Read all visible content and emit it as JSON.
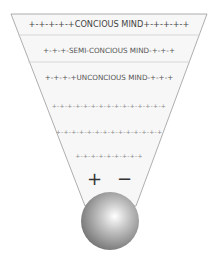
{
  "diagram": {
    "title": "",
    "levels": [
      {
        "label": "+-+-+-+-+CONCIOUS MIND+-+-+-+-+",
        "y": 18
      },
      {
        "label": "+-+-+-SEMI-CONCIOUS MIND-+-+-+",
        "y": 45
      },
      {
        "label": "+-+-+-+UNCONCIOUS MIND-+-+-+",
        "y": 72
      },
      {
        "label": "+-+-+-+-+-+-+-+-+-+-+-+-+-+-+",
        "y": 100
      },
      {
        "label": "+-+-+-+-+-+-+-+-+-+-+-+-+-+",
        "y": 125
      },
      {
        "label": "+-+-+-+-+-+-+-+-+",
        "y": 150
      }
    ],
    "polarity": {
      "plus": "+",
      "minus": "−"
    },
    "colors": {
      "funnel_fill": "#f6f6f6",
      "funnel_stroke": "#9a9a9a",
      "divider": "#c8c8c8",
      "sphere_light": "#ffffff",
      "sphere_dark": "#6e6e6e"
    }
  }
}
